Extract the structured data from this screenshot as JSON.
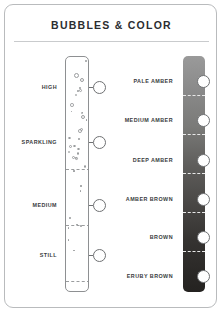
{
  "card": {
    "title": "BUBBLES & COLOR",
    "border_color": "#b9bbbd",
    "title_color": "#2b2d30"
  },
  "bubbles_scale": {
    "name": "bubbles",
    "axis_label": "Bubbles",
    "levels": [
      {
        "label": "HIGH",
        "y": 82
      },
      {
        "label": "SPARKLING",
        "y": 137
      },
      {
        "label": "MEDIUM",
        "y": 200
      },
      {
        "label": "STILL",
        "y": 250
      }
    ]
  },
  "color_scale": {
    "name": "color",
    "axis_label": "Color",
    "gradient_from": "#9a9a9a",
    "gradient_to": "#242220",
    "levels": [
      {
        "label": "PALE AMBER",
        "y": 76,
        "swatch": "#9a9a9a"
      },
      {
        "label": "MEDIUM AMBER",
        "y": 115,
        "swatch": "#818180"
      },
      {
        "label": "DEEP AMBER",
        "y": 155,
        "swatch": "#605e5c"
      },
      {
        "label": "AMBER BROWN",
        "y": 194,
        "swatch": "#4a4846"
      },
      {
        "label": "BROWN",
        "y": 232,
        "swatch": "#343230"
      },
      {
        "label": "ERUBY BROWN",
        "y": 271,
        "swatch": "#262422"
      }
    ]
  },
  "chart_data": {
    "type": "table",
    "title": "BUBBLES & COLOR",
    "series": [
      {
        "name": "Bubbles",
        "values": [
          "HIGH",
          "SPARKLING",
          "MEDIUM",
          "STILL"
        ]
      },
      {
        "name": "Color",
        "values": [
          "PALE AMBER",
          "MEDIUM AMBER",
          "DEEP AMBER",
          "AMBER BROWN",
          "BROWN",
          "ERUBY BROWN"
        ]
      }
    ]
  }
}
